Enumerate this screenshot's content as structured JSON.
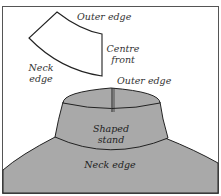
{
  "diagram": {
    "colors": {
      "background": "#ffffff",
      "stroke": "#222222",
      "fill_grey": "#a9a9a9",
      "frame": "#555555",
      "text": "#333333"
    },
    "pattern_piece": {
      "labels": {
        "outer_edge": "Outer edge",
        "centre_front_line1": "Centre",
        "centre_front_line2": "front",
        "neck_edge_line1": "Neck",
        "neck_edge_line2": "edge"
      }
    },
    "garment": {
      "labels": {
        "outer_edge": "Outer edge",
        "shaped_stand_line1": "Shaped",
        "shaped_stand_line2": "stand",
        "neck_edge": "Neck edge"
      }
    }
  }
}
